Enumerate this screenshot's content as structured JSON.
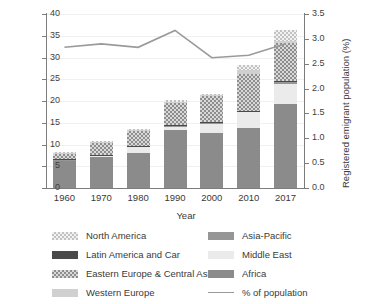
{
  "chart_data": {
    "type": "bar",
    "title": "",
    "subtitle": "",
    "xlabel": "Year",
    "ylabel": "Registered emigrant population (millions)",
    "ylabel_right": "Registered emigrant population (%)",
    "categories": [
      "1960",
      "1970",
      "1980",
      "1990",
      "2000",
      "2010",
      "2017"
    ],
    "ylim": [
      0,
      40
    ],
    "yticks": [
      "0",
      "5",
      "10",
      "15",
      "20",
      "25",
      "30",
      "35",
      "40"
    ],
    "ylim_right": [
      0,
      3.5
    ],
    "yticks_right": [
      "0.0",
      "0.5",
      "1.0",
      "1.5",
      "2.0",
      "2.5",
      "3.0",
      "3.5"
    ],
    "grid": true,
    "stacked": true,
    "legend_position": "bottom",
    "series": [
      {
        "name": "Africa",
        "key": "africa",
        "color": "#8b8b8b",
        "values": [
          6.3,
          7.2,
          8.1,
          13.4,
          12.6,
          13.9,
          19.4
        ]
      },
      {
        "name": "Middle East",
        "key": "middle-east",
        "color": "#ebebeb",
        "values": [
          0.15,
          0.2,
          1.3,
          0.6,
          2.2,
          3.5,
          4.6
        ]
      },
      {
        "name": "Asia-Pacific",
        "key": "asia-pacific",
        "color": "#969696",
        "values": [
          0.1,
          0.1,
          0.15,
          0.35,
          0.25,
          0.25,
          0.3
        ]
      },
      {
        "name": "Latin America and Car",
        "key": "latin-america",
        "color": "#4a4a4a",
        "values": [
          0.05,
          0.05,
          0.1,
          0.1,
          0.1,
          0.15,
          0.2
        ]
      },
      {
        "name": "Eastern Europe & Central Asia",
        "key": "eastern-europe",
        "color": "#d9d9d9",
        "values": [
          1.3,
          2.9,
          3.5,
          5.0,
          5.9,
          8.3,
          8.9
        ]
      },
      {
        "name": "Western Europe",
        "key": "western-europe",
        "color": "#d0d0d0",
        "values": [
          0.15,
          0.2,
          0.25,
          0.3,
          0.3,
          1.0,
          0.4
        ]
      },
      {
        "name": "North America",
        "key": "north-america",
        "color": "#f2f2f2",
        "values": [
          0.15,
          0.15,
          0.2,
          0.45,
          0.25,
          1.2,
          2.5
        ]
      }
    ],
    "line_series": {
      "name": "% of population",
      "color": "#9a9a9a",
      "axis": "right",
      "values": [
        2.83,
        2.9,
        2.83,
        3.17,
        2.62,
        2.67,
        2.9
      ]
    },
    "bar_totals": [
      8.2,
      10.8,
      13.6,
      20.2,
      21.6,
      28.3,
      36.3
    ]
  },
  "axes": {
    "left_title": "Registered emigrant population (millions)",
    "right_title": "Registered emigrant population (%)",
    "x_title": "Year"
  },
  "legend": {
    "column1": [
      {
        "label": "North America",
        "key": "north-america",
        "type": "swatch"
      },
      {
        "label": "Latin America and Car",
        "key": "latin-america",
        "type": "swatch"
      },
      {
        "label": "Eastern Europe & Central Asia",
        "key": "eastern-europe",
        "type": "swatch"
      },
      {
        "label": "Western Europe",
        "key": "western-europe",
        "type": "swatch"
      }
    ],
    "column2": [
      {
        "label": "Asia-Pacific",
        "key": "asia-pacific",
        "type": "swatch"
      },
      {
        "label": "Middle East",
        "key": "middle-east",
        "type": "swatch"
      },
      {
        "label": "Africa",
        "key": "africa",
        "type": "swatch"
      },
      {
        "label": "% of population",
        "key": "pct-line",
        "type": "line"
      }
    ]
  }
}
